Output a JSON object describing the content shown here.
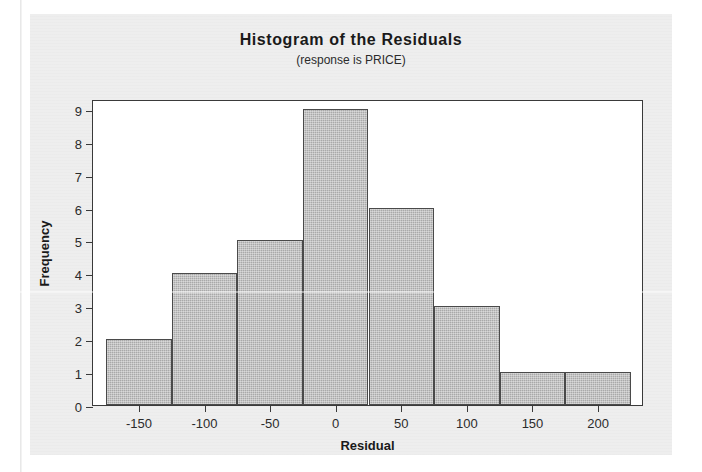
{
  "figure": {
    "title": "Histogram of the Residuals",
    "subtitle": "(response is PRICE)",
    "panel_color": "#eeeeee",
    "plot_background": "#ffffff",
    "bar_fill_color": "#a9a9a9",
    "bar_edge_color": "#4a4a4a",
    "axis_color": "#3a3a3a"
  },
  "chart_data": {
    "type": "bar",
    "title": "Histogram of the Residuals",
    "subtitle": "(response is PRICE)",
    "xlabel": "Residual",
    "ylabel": "Frequency",
    "xlim": [
      -185,
      235
    ],
    "ylim": [
      0,
      9.3
    ],
    "grid": false,
    "legend": null,
    "bin_width": 50,
    "categories": [
      "-175 to -125",
      "-125 to -75",
      "-75 to -25",
      "-25 to 25",
      "25 to 75",
      "75 to 125",
      "125 to 175",
      "175 to 225"
    ],
    "bin_centers": [
      -150,
      -100,
      -50,
      0,
      50,
      100,
      150,
      200
    ],
    "bin_edges": [
      -175,
      -125,
      -75,
      -25,
      25,
      75,
      125,
      175,
      225
    ],
    "values": [
      2,
      4,
      5,
      9,
      6,
      3,
      1,
      1
    ],
    "xticks": [
      -150,
      -100,
      -50,
      0,
      50,
      100,
      150,
      200
    ],
    "xticklabels": [
      "-150",
      "-100",
      "-50",
      "0",
      "50",
      "100",
      "150",
      "200"
    ],
    "yticks": [
      0,
      1,
      2,
      3,
      4,
      5,
      6,
      7,
      8,
      9
    ],
    "yticklabels": [
      "0",
      "1",
      "2",
      "3",
      "4",
      "5",
      "6",
      "7",
      "8",
      "9"
    ],
    "total_count": 31
  }
}
